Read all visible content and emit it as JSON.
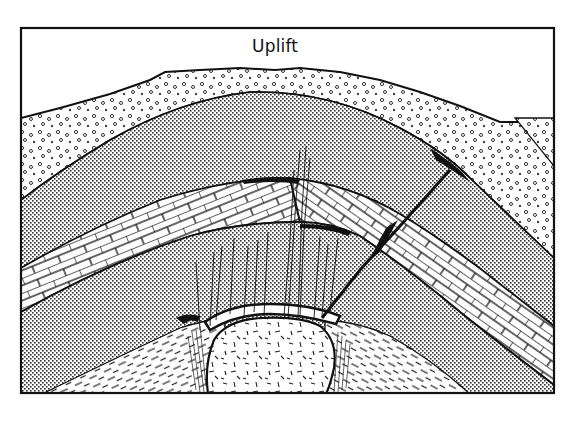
{
  "figure": {
    "title": "Uplift",
    "type": "geological cross-section",
    "colors": {
      "ink": "#111111",
      "paper": "#ffffff",
      "stipple": "#555555"
    },
    "layers": [
      {
        "id": "gravel",
        "pattern": "open-circles",
        "description": "surface gravel / conglomerate layer"
      },
      {
        "id": "sandstone-upper",
        "pattern": "fine-stipple",
        "description": "upper stippled sedimentary layer"
      },
      {
        "id": "limestone",
        "pattern": "brick",
        "description": "folded limestone band"
      },
      {
        "id": "sandstone-lower",
        "pattern": "fine-stipple",
        "description": "lower stippled sedimentary layer"
      },
      {
        "id": "shale",
        "pattern": "dashes",
        "description": "basal shale"
      },
      {
        "id": "intrusion",
        "pattern": "random-dashes",
        "description": "igneous intrusion (stock)"
      }
    ],
    "features": [
      {
        "id": "fault",
        "description": "diagonal fault cutting the anticline"
      },
      {
        "id": "fractures",
        "description": "vein fractures above intrusion"
      }
    ]
  }
}
